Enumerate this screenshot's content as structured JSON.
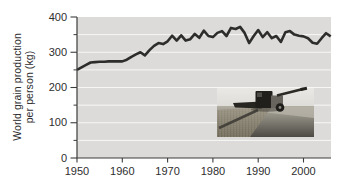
{
  "chart_data": {
    "type": "line",
    "title": "",
    "xlabel": "",
    "ylabel": "World grain production per person (kg)",
    "ylabel_line1": "World grain production",
    "ylabel_line2": "per person (kg)",
    "legend": "none",
    "grid": "horizontal white gridlines every 50 kg",
    "xlim": [
      1950,
      2006
    ],
    "ylim": [
      0,
      400
    ],
    "x_ticks": [
      "1950",
      "1960",
      "1970",
      "1980",
      "1990",
      "2000"
    ],
    "y_ticks": [
      "0",
      "100",
      "200",
      "300",
      "400"
    ],
    "y_minor_ticks": [
      50,
      150,
      250,
      350
    ],
    "years": [
      1950,
      1951,
      1952,
      1953,
      1954,
      1955,
      1956,
      1957,
      1958,
      1959,
      1960,
      1961,
      1962,
      1963,
      1964,
      1965,
      1966,
      1967,
      1968,
      1969,
      1970,
      1971,
      1972,
      1973,
      1974,
      1975,
      1976,
      1977,
      1978,
      1979,
      1980,
      1981,
      1982,
      1983,
      1984,
      1985,
      1986,
      1987,
      1988,
      1989,
      1990,
      1991,
      1992,
      1993,
      1994,
      1995,
      1996,
      1997,
      1998,
      1999,
      2000,
      2001,
      2002,
      2003,
      2004,
      2005,
      2006
    ],
    "values": [
      250,
      257,
      264,
      271,
      272,
      273,
      273,
      274,
      274,
      274,
      274,
      279,
      287,
      294,
      300,
      291,
      306,
      318,
      326,
      323,
      331,
      347,
      333,
      348,
      333,
      337,
      352,
      341,
      361,
      346,
      343,
      355,
      360,
      346,
      369,
      366,
      372,
      355,
      326,
      346,
      363,
      343,
      357,
      340,
      346,
      329,
      357,
      360,
      350,
      347,
      345,
      340,
      327,
      324,
      340,
      354,
      345
    ],
    "colors": {
      "line": "#2d2d2c",
      "plot_background": "#dcdbd9",
      "gridline": "#f7f7f6",
      "axis": "#3c3c3c",
      "text": "#2e2e2e"
    },
    "inset": {
      "description": "grayscale photo of a combine harvester cutting a grain field",
      "text": ""
    }
  }
}
